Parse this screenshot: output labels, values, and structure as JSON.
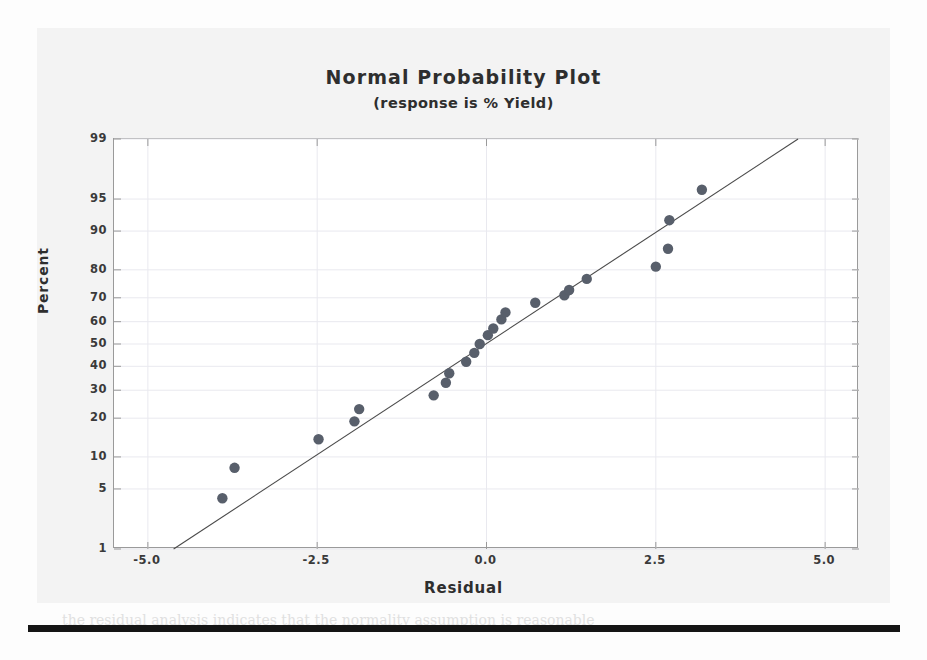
{
  "page": {
    "ghost_heading": "12.12  Conclusions and Future Means",
    "ghost_line_1": "make the resulting part defects smaller and also the specification limits",
    "ghost_line_2": "and so the process capability index would be improved as well",
    "ghost_line_3": "the residual analysis indicates that the normality assumption is reasonable"
  },
  "chart_data": {
    "type": "scatter",
    "title": "Normal Probability Plot",
    "subtitle": "(response is % Yield)",
    "xlabel": "Residual",
    "ylabel": "Percent",
    "xlim": [
      -5.5,
      5.5
    ],
    "xticks": [
      -5.0,
      -2.5,
      0.0,
      2.5,
      5.0
    ],
    "xticklabels": [
      "-5.0",
      "-2.5",
      "0.0",
      "2.5",
      "5.0"
    ],
    "yscale": "probit",
    "ylim": [
      1,
      99
    ],
    "yticks": [
      99,
      95,
      90,
      80,
      70,
      60,
      50,
      40,
      30,
      20,
      10,
      5,
      1
    ],
    "yticklabels": [
      "99",
      "95",
      "90",
      "80",
      "70",
      "60",
      "50",
      "40",
      "30",
      "20",
      "10",
      "5",
      "1"
    ],
    "grid": true,
    "legend": "none",
    "marker_color": "#585f6b",
    "line_color": "#4a4a4a",
    "n_points": 22,
    "points": [
      {
        "x": -3.9,
        "y": 4
      },
      {
        "x": -3.72,
        "y": 8
      },
      {
        "x": -2.48,
        "y": 14
      },
      {
        "x": -1.95,
        "y": 19
      },
      {
        "x": -1.88,
        "y": 23
      },
      {
        "x": -0.78,
        "y": 28
      },
      {
        "x": -0.6,
        "y": 33
      },
      {
        "x": -0.55,
        "y": 37
      },
      {
        "x": -0.3,
        "y": 42
      },
      {
        "x": -0.18,
        "y": 46
      },
      {
        "x": -0.1,
        "y": 50
      },
      {
        "x": 0.02,
        "y": 54
      },
      {
        "x": 0.1,
        "y": 57
      },
      {
        "x": 0.22,
        "y": 61
      },
      {
        "x": 0.28,
        "y": 64
      },
      {
        "x": 0.72,
        "y": 68
      },
      {
        "x": 1.15,
        "y": 71
      },
      {
        "x": 1.22,
        "y": 73
      },
      {
        "x": 1.48,
        "y": 77
      },
      {
        "x": 2.5,
        "y": 81
      },
      {
        "x": 2.68,
        "y": 86
      },
      {
        "x": 2.7,
        "y": 92
      },
      {
        "x": 3.18,
        "y": 96
      }
    ],
    "reference_line": {
      "x_start": -4.62,
      "y_start": 1,
      "x_end": 4.6,
      "y_end": 99
    }
  }
}
